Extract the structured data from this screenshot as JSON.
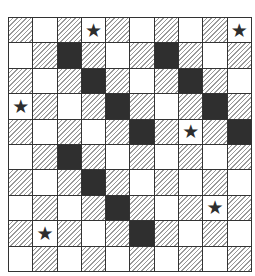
{
  "board": {
    "rows": 10,
    "cols": 10,
    "legend": {
      "H": "hatched",
      "W": "white",
      "D": "dark",
      "S": "star"
    },
    "star_glyph": "★",
    "grid": [
      [
        "H",
        "W",
        "H",
        "S",
        "H",
        "W",
        "H",
        "W",
        "H",
        "S"
      ],
      [
        "W",
        "H",
        "D",
        "H",
        "W",
        "H",
        "D",
        "H",
        "W",
        "H"
      ],
      [
        "H",
        "W",
        "H",
        "D",
        "H",
        "W",
        "H",
        "D",
        "H",
        "W"
      ],
      [
        "S",
        "H",
        "W",
        "H",
        "D",
        "H",
        "W",
        "H",
        "D",
        "H"
      ],
      [
        "H",
        "W",
        "H",
        "W",
        "H",
        "D",
        "H",
        "S",
        "H",
        "D"
      ],
      [
        "W",
        "H",
        "D",
        "H",
        "W",
        "H",
        "W",
        "H",
        "W",
        "H"
      ],
      [
        "H",
        "W",
        "H",
        "D",
        "H",
        "W",
        "H",
        "W",
        "H",
        "W"
      ],
      [
        "W",
        "H",
        "W",
        "H",
        "D",
        "H",
        "W",
        "H",
        "S",
        "H"
      ],
      [
        "H",
        "S",
        "H",
        "W",
        "H",
        "D",
        "H",
        "W",
        "H",
        "W"
      ],
      [
        "W",
        "H",
        "W",
        "H",
        "W",
        "H",
        "W",
        "H",
        "W",
        "H"
      ]
    ]
  }
}
